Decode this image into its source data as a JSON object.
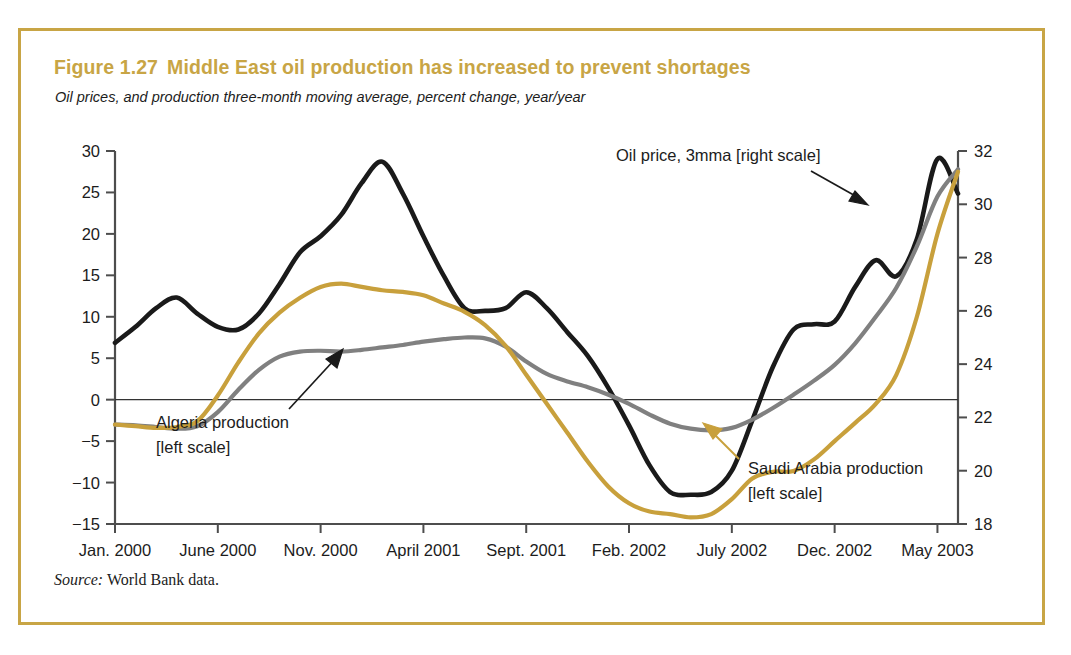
{
  "figure": {
    "number": "Figure 1.27",
    "title": "Middle East oil production has increased to prevent shortages",
    "subtitle": "Oil prices, and production three-month moving average, percent change, year/year",
    "source_label": "Source:",
    "source_text": "World Bank data.",
    "border_color": "#c8a545",
    "title_color": "#c8a545"
  },
  "chart_data": {
    "type": "line",
    "title": "Middle East oil production has increased to prevent shortages",
    "subtitle": "Oil prices, and production three-month moving average, percent change, year/year",
    "xlabel": "",
    "ylabel": "",
    "ylabel_right": "",
    "grid": false,
    "legend_position": "inline-annotations",
    "x_tick_labels": [
      "Jan. 2000",
      "June 2000",
      "Nov. 2000",
      "April 2001",
      "Sept. 2001",
      "Feb. 2002",
      "July 2002",
      "Dec. 2002",
      "May 2003"
    ],
    "x_tick_months": [
      0,
      5,
      10,
      15,
      20,
      25,
      30,
      35,
      40
    ],
    "x_range_months": [
      0,
      41
    ],
    "left_axis": {
      "label": "percent change, year/year",
      "ticks": [
        30,
        25,
        20,
        15,
        10,
        5,
        0,
        -5,
        -10,
        -15
      ],
      "ylim": [
        -15,
        30
      ]
    },
    "right_axis": {
      "label": "oil price",
      "ticks": [
        32,
        30,
        28,
        26,
        24,
        22,
        20,
        18
      ],
      "ylim": [
        18,
        32
      ]
    },
    "zero_line": 0,
    "series": [
      {
        "name": "Oil price, 3mma [right scale]",
        "axis": "right",
        "color": "#1a1a1a",
        "annotation": "Oil price, 3mma [right scale]",
        "x": [
          0,
          1,
          2,
          3,
          4,
          5,
          6,
          7,
          8,
          9,
          10,
          11,
          12,
          13,
          14,
          15,
          16,
          17,
          18,
          19,
          20,
          21,
          22,
          23,
          24,
          25,
          26,
          27,
          28,
          29,
          30,
          31,
          32,
          33,
          34,
          35,
          36,
          37,
          38,
          39,
          40,
          41
        ],
        "values_left_scale": [
          7.0,
          9.0,
          11.5,
          13.0,
          11.0,
          9.5,
          9.2,
          11.0,
          15.0,
          19.0,
          21.0,
          23.5,
          27.5,
          30.0,
          26.0,
          21.0,
          16.0,
          11.5,
          11.2,
          11.5,
          13.3,
          11.5,
          8.5,
          5.5,
          1.5,
          -3.0,
          -8.0,
          -11.5,
          -12.0,
          -11.8,
          -9.0,
          -3.0,
          3.5,
          8.0,
          8.6,
          8.8,
          13.0,
          16.0,
          14.5,
          19.0,
          28.5,
          26.0
        ],
        "values_right_scale": [
          24.8,
          25.4,
          26.1,
          26.5,
          25.9,
          25.4,
          25.3,
          25.9,
          27.0,
          28.2,
          28.8,
          29.6,
          30.8,
          31.6,
          30.4,
          28.8,
          27.3,
          26.1,
          26.0,
          26.1,
          26.7,
          26.1,
          25.2,
          24.3,
          23.1,
          21.7,
          20.2,
          19.2,
          19.1,
          19.2,
          20.0,
          21.9,
          23.9,
          25.3,
          25.5,
          25.6,
          26.9,
          27.9,
          27.3,
          28.7,
          31.7,
          30.4
        ]
      },
      {
        "name": "Algeria production [left scale]",
        "axis": "left",
        "color": "#808080",
        "annotation": "Algeria production [left scale]",
        "x": [
          0,
          1,
          2,
          3,
          4,
          5,
          6,
          7,
          8,
          9,
          10,
          11,
          12,
          13,
          14,
          15,
          16,
          17,
          18,
          19,
          20,
          21,
          22,
          23,
          24,
          25,
          26,
          27,
          28,
          29,
          30,
          31,
          32,
          33,
          34,
          35,
          36,
          37,
          38,
          39,
          40,
          41
        ],
        "values": [
          -3.0,
          -3.1,
          -3.3,
          -3.5,
          -3.2,
          -1.5,
          1.2,
          3.6,
          5.2,
          5.8,
          5.9,
          5.8,
          6.0,
          6.3,
          6.6,
          7.0,
          7.3,
          7.5,
          7.4,
          6.4,
          4.6,
          3.1,
          2.2,
          1.5,
          0.6,
          -0.5,
          -1.8,
          -2.9,
          -3.5,
          -3.7,
          -3.4,
          -2.4,
          -1.0,
          0.6,
          2.3,
          4.2,
          6.8,
          10.0,
          13.5,
          18.5,
          24.5,
          27.8
        ]
      },
      {
        "name": "Saudi Arabia production [left scale]",
        "axis": "left",
        "color": "#c8a03c",
        "annotation": "Saudi Arabia production [left scale]",
        "x": [
          0,
          1,
          2,
          3,
          4,
          5,
          6,
          7,
          8,
          9,
          10,
          11,
          12,
          13,
          14,
          15,
          16,
          17,
          18,
          19,
          20,
          21,
          22,
          23,
          24,
          25,
          26,
          27,
          28,
          29,
          30,
          31,
          32,
          33,
          34,
          35,
          36,
          37,
          38,
          39,
          40,
          41
        ],
        "values": [
          -3.0,
          -3.2,
          -3.4,
          -3.3,
          -2.6,
          0.5,
          4.5,
          8.0,
          10.5,
          12.3,
          13.6,
          14.0,
          13.6,
          13.2,
          13.0,
          12.6,
          11.6,
          10.6,
          9.0,
          6.5,
          3.0,
          -0.5,
          -4.0,
          -7.5,
          -10.5,
          -12.5,
          -13.5,
          -13.8,
          -14.2,
          -13.8,
          -12.0,
          -9.5,
          -8.7,
          -8.6,
          -7.2,
          -5.0,
          -2.8,
          -0.5,
          3.0,
          10.0,
          20.0,
          27.5
        ]
      }
    ],
    "annotations": [
      {
        "text": "Oil price, 3mma [right scale]",
        "arrow": "down-right",
        "color": "#1a1a1a"
      },
      {
        "text": "Algeria production",
        "text2": "[left scale]",
        "arrow": "up-right",
        "color": "#1a1a1a"
      },
      {
        "text": "Saudi Arabia production",
        "text2": "[left scale]",
        "arrow": "up-left",
        "color": "#c8a03c"
      }
    ]
  }
}
